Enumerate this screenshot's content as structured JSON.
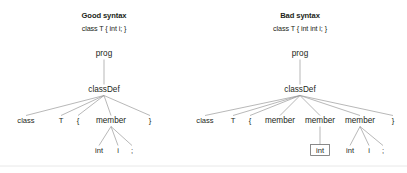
{
  "figure": {
    "background_color": "#ffffff",
    "text_color": "#231f20",
    "edge_color": "#9a9a9a",
    "error_outline_color": "#6d6d6d",
    "footer_rule_color": "#e8e8e8"
  },
  "panels": [
    {
      "id": "good",
      "title": "Good syntax",
      "subtitle": "class T { int i; }",
      "title_x": 104,
      "title_y": 18,
      "subtitle_x": 104,
      "subtitle_y": 31,
      "nodes": [
        {
          "name": "prog",
          "label": "prog",
          "x": 104,
          "y": 56,
          "kind": "rule",
          "boxed": false
        },
        {
          "name": "classDef",
          "label": "classDef",
          "x": 104,
          "y": 92,
          "kind": "rule",
          "boxed": false
        },
        {
          "name": "class-kw",
          "label": "class",
          "x": 26,
          "y": 123,
          "kind": "token",
          "boxed": false
        },
        {
          "name": "type-id",
          "label": "T",
          "x": 61,
          "y": 123,
          "kind": "token",
          "boxed": false
        },
        {
          "name": "lbrace",
          "label": "{",
          "x": 78,
          "y": 123,
          "kind": "token",
          "boxed": false
        },
        {
          "name": "member",
          "label": "member",
          "x": 111,
          "y": 123,
          "kind": "rule",
          "boxed": false
        },
        {
          "name": "rbrace",
          "label": "}",
          "x": 150,
          "y": 123,
          "kind": "token",
          "boxed": false
        },
        {
          "name": "int-kw",
          "label": "int",
          "x": 99,
          "y": 153,
          "kind": "token",
          "boxed": false
        },
        {
          "name": "var-id",
          "label": "i",
          "x": 118,
          "y": 153,
          "kind": "token",
          "boxed": false
        },
        {
          "name": "semi",
          "label": ";",
          "x": 132,
          "y": 153,
          "kind": "token",
          "boxed": false
        }
      ],
      "edges": [
        {
          "from": "prog",
          "to": "classDef"
        },
        {
          "from": "classDef",
          "to": "class-kw"
        },
        {
          "from": "classDef",
          "to": "type-id"
        },
        {
          "from": "classDef",
          "to": "lbrace"
        },
        {
          "from": "classDef",
          "to": "member"
        },
        {
          "from": "classDef",
          "to": "rbrace"
        },
        {
          "from": "member",
          "to": "int-kw"
        },
        {
          "from": "member",
          "to": "var-id"
        },
        {
          "from": "member",
          "to": "semi"
        }
      ]
    },
    {
      "id": "bad",
      "title": "Bad syntax",
      "subtitle": "class T { int int i; }",
      "title_x": 300,
      "title_y": 18,
      "subtitle_x": 300,
      "subtitle_y": 31,
      "nodes": [
        {
          "name": "prog",
          "label": "prog",
          "x": 300,
          "y": 56,
          "kind": "rule",
          "boxed": false
        },
        {
          "name": "classDef",
          "label": "classDef",
          "x": 300,
          "y": 92,
          "kind": "rule",
          "boxed": false
        },
        {
          "name": "class-kw",
          "label": "class",
          "x": 205,
          "y": 123,
          "kind": "token",
          "boxed": false
        },
        {
          "name": "type-id",
          "label": "T",
          "x": 233,
          "y": 123,
          "kind": "token",
          "boxed": false
        },
        {
          "name": "lbrace",
          "label": "{",
          "x": 250,
          "y": 123,
          "kind": "token",
          "boxed": false
        },
        {
          "name": "member-1",
          "label": "member",
          "x": 280,
          "y": 123,
          "kind": "rule",
          "boxed": false
        },
        {
          "name": "member-2",
          "label": "member",
          "x": 320,
          "y": 123,
          "kind": "rule",
          "boxed": false
        },
        {
          "name": "member-3",
          "label": "member",
          "x": 360,
          "y": 123,
          "kind": "rule",
          "boxed": false
        },
        {
          "name": "rbrace",
          "label": "}",
          "x": 393,
          "y": 123,
          "kind": "token",
          "boxed": false
        },
        {
          "name": "int-error",
          "label": "int",
          "x": 320,
          "y": 153,
          "kind": "token",
          "boxed": true
        },
        {
          "name": "int-kw",
          "label": "int",
          "x": 350,
          "y": 153,
          "kind": "token",
          "boxed": false
        },
        {
          "name": "var-id",
          "label": "i",
          "x": 369,
          "y": 153,
          "kind": "token",
          "boxed": false
        },
        {
          "name": "semi",
          "label": ";",
          "x": 383,
          "y": 153,
          "kind": "token",
          "boxed": false
        }
      ],
      "edges": [
        {
          "from": "prog",
          "to": "classDef"
        },
        {
          "from": "classDef",
          "to": "class-kw"
        },
        {
          "from": "classDef",
          "to": "type-id"
        },
        {
          "from": "classDef",
          "to": "lbrace"
        },
        {
          "from": "classDef",
          "to": "member-1"
        },
        {
          "from": "classDef",
          "to": "member-2"
        },
        {
          "from": "classDef",
          "to": "member-3"
        },
        {
          "from": "classDef",
          "to": "rbrace"
        },
        {
          "from": "member-2",
          "to": "int-error"
        },
        {
          "from": "member-3",
          "to": "int-kw"
        },
        {
          "from": "member-3",
          "to": "var-id"
        },
        {
          "from": "member-3",
          "to": "semi"
        }
      ]
    }
  ],
  "footer_rule": {
    "x1": 0,
    "x2": 407,
    "y": 166
  }
}
